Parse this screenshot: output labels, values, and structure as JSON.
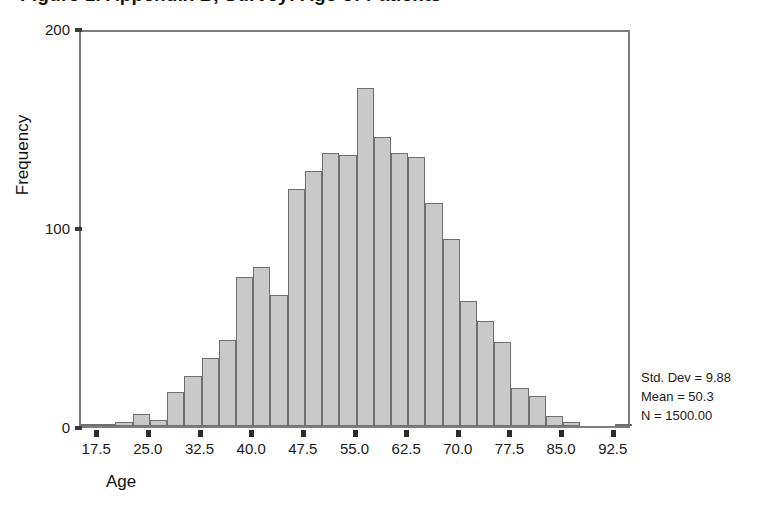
{
  "chart_data": {
    "type": "bar",
    "title": "Figure 1.  Appendix B, Survey: Age of Patients",
    "subtitle": "",
    "xlabel": "Age",
    "ylabel": "Frequency",
    "xlim": [
      15.0,
      95.0
    ],
    "ylim": [
      0,
      200
    ],
    "grid": false,
    "legend_position": "none",
    "bin_width": 2.5,
    "x_ticks": [
      "17.5",
      "25.0",
      "32.5",
      "40.0",
      "47.5",
      "55.0",
      "62.5",
      "70.0",
      "77.5",
      "85.0",
      "92.5"
    ],
    "x_tick_values": [
      17.5,
      25.0,
      32.5,
      40.0,
      47.5,
      55.0,
      62.5,
      70.0,
      77.5,
      85.0,
      92.5
    ],
    "y_ticks": [
      "0",
      "100",
      "200"
    ],
    "y_tick_values": [
      0,
      100,
      200
    ],
    "bin_centers": [
      16.25,
      18.75,
      21.25,
      23.75,
      26.25,
      28.75,
      31.25,
      33.75,
      36.25,
      38.75,
      41.25,
      43.75,
      46.25,
      48.75,
      51.25,
      53.75,
      56.25,
      58.75,
      61.25,
      63.75,
      66.25,
      68.75,
      71.25,
      73.75,
      76.25,
      78.75,
      81.25,
      83.75,
      86.25,
      88.75,
      91.25,
      93.75
    ],
    "categories": [
      "16.25",
      "18.75",
      "21.25",
      "23.75",
      "26.25",
      "28.75",
      "31.25",
      "33.75",
      "36.25",
      "38.75",
      "41.25",
      "43.75",
      "46.25",
      "48.75",
      "51.25",
      "53.75",
      "56.25",
      "58.75",
      "61.25",
      "63.75",
      "66.25",
      "68.75",
      "71.25",
      "73.75",
      "76.25",
      "78.75",
      "81.25",
      "83.75",
      "86.25",
      "88.75",
      "91.25",
      "93.75"
    ],
    "values": [
      1,
      1,
      2,
      6,
      3,
      17,
      25,
      34,
      43,
      75,
      80,
      66,
      119,
      128,
      137,
      136,
      170,
      145,
      137,
      135,
      112,
      94,
      63,
      53,
      42,
      19,
      15,
      5,
      2,
      0,
      0,
      1
    ],
    "annotations": [
      "Std. Dev = 9.88",
      "Mean = 50.3",
      "N = 1500.00"
    ]
  },
  "stats": {
    "std_dev": "Std. Dev = 9.88",
    "mean": "Mean = 50.3",
    "n": "N = 1500.00"
  },
  "axes": {
    "x_title": "Age",
    "y_title": "Frequency"
  },
  "colors": {
    "bar_fill": "#c9c9c9",
    "bar_border": "#6f6f6f",
    "frame": "#7d7d7d",
    "text": "#1a1a1a"
  }
}
